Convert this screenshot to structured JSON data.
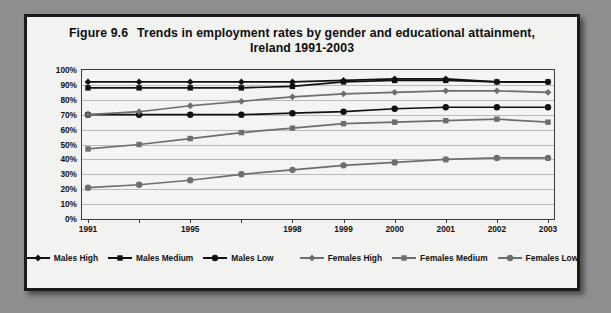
{
  "figure": {
    "number": "Figure 9.6",
    "title_line1": "Trends in employment rates by gender and educational attainment,",
    "title_line2": "Ireland 1991-2003"
  },
  "chart_data": {
    "type": "line",
    "xlabel": "",
    "ylabel": "",
    "ylim": [
      0,
      100
    ],
    "ytick_values": [
      0,
      10,
      20,
      30,
      40,
      50,
      60,
      70,
      80,
      90,
      100
    ],
    "ytick_labels": [
      "0%",
      "10%",
      "20%",
      "30%",
      "40%",
      "50%",
      "60%",
      "70%",
      "80%",
      "90%",
      "100%"
    ],
    "grid": "horizontal",
    "legend_position": "bottom",
    "x": [
      1991,
      1993,
      1995,
      1997,
      1998,
      1999,
      2000,
      2001,
      2002,
      2003
    ],
    "xtick_labels": [
      "1991",
      "",
      "1995",
      "",
      "1998",
      "1999",
      "2000",
      "2001",
      "2002",
      "2003"
    ],
    "xtick_labels_shown": [
      "1991",
      "1995",
      "1998",
      "1999",
      "2000",
      "2001",
      "2002",
      "2003"
    ],
    "series": [
      {
        "name": "Males High",
        "marker": "diamond",
        "color": "#111111",
        "values": [
          92,
          92,
          92,
          92,
          92,
          93,
          94,
          94,
          92,
          92
        ]
      },
      {
        "name": "Males Medium",
        "marker": "square",
        "color": "#111111",
        "values": [
          88,
          88,
          88,
          88,
          89,
          92,
          93,
          93,
          92,
          92
        ]
      },
      {
        "name": "Males Low",
        "marker": "circle",
        "color": "#111111",
        "values": [
          70,
          70,
          70,
          70,
          71,
          72,
          74,
          75,
          75,
          75
        ]
      },
      {
        "name": "Females High",
        "marker": "diamond",
        "color": "#6e6e6e",
        "values": [
          70,
          72,
          76,
          79,
          82,
          84,
          85,
          86,
          86,
          85
        ]
      },
      {
        "name": "Females Medium",
        "marker": "square",
        "color": "#6e6e6e",
        "values": [
          47,
          50,
          54,
          58,
          61,
          64,
          65,
          66,
          67,
          65
        ]
      },
      {
        "name": "Females Low",
        "marker": "circle",
        "color": "#6e6e6e",
        "values": [
          21,
          23,
          26,
          30,
          33,
          36,
          38,
          40,
          41,
          41
        ]
      }
    ]
  },
  "legend": {
    "items": [
      {
        "label": "Males High",
        "marker": "diamond",
        "color": "#111111"
      },
      {
        "label": "Males Medium",
        "marker": "square",
        "color": "#111111"
      },
      {
        "label": "Males Low",
        "marker": "circle",
        "color": "#111111"
      },
      {
        "label": "Females High",
        "marker": "diamond",
        "color": "#6e6e6e"
      },
      {
        "label": "Females Medium",
        "marker": "square",
        "color": "#6e6e6e"
      },
      {
        "label": "Females Low",
        "marker": "circle",
        "color": "#6e6e6e"
      }
    ]
  }
}
